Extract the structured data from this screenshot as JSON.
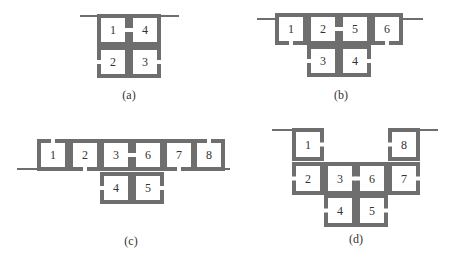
{
  "colors": {
    "wall": "#6e6e6e",
    "text": "#333333",
    "background": "#ffffff"
  },
  "panels": [
    {
      "id": "a",
      "caption": "(a)",
      "caption_pos": [
        129,
        99
      ],
      "lines": [
        [
          [
            80,
            16
          ],
          [
            99,
            16
          ]
        ],
        [
          [
            159,
            16
          ],
          [
            179,
            16
          ]
        ]
      ],
      "boxes": [
        {
          "label": "1",
          "x": 99,
          "y": 16,
          "w": 28,
          "h": 28,
          "gap": "right"
        },
        {
          "label": "4",
          "x": 131,
          "y": 16,
          "w": 28,
          "h": 28,
          "gap": "left"
        },
        {
          "label": "2",
          "x": 99,
          "y": 48,
          "w": 28,
          "h": 28,
          "gap": "left"
        },
        {
          "label": "3",
          "x": 131,
          "y": 48,
          "w": 28,
          "h": 28,
          "gap": "right"
        }
      ]
    },
    {
      "id": "b",
      "caption": "(b)",
      "caption_pos": [
        341,
        99
      ],
      "lines": [
        [
          [
            257,
            19
          ],
          [
            277,
            19
          ]
        ],
        [
          [
            401,
            19
          ],
          [
            423,
            19
          ]
        ]
      ],
      "boxes": [
        {
          "label": "1",
          "x": 277,
          "y": 15,
          "w": 28,
          "h": 28,
          "gap": "bottom"
        },
        {
          "label": "2",
          "x": 309,
          "y": 15,
          "w": 28,
          "h": 28,
          "gap": "right"
        },
        {
          "label": "5",
          "x": 341,
          "y": 15,
          "w": 28,
          "h": 28,
          "gap": "left"
        },
        {
          "label": "6",
          "x": 373,
          "y": 15,
          "w": 28,
          "h": 28,
          "gap": "bottom"
        },
        {
          "label": "3",
          "x": 309,
          "y": 47,
          "w": 28,
          "h": 28,
          "gap": "left"
        },
        {
          "label": "4",
          "x": 341,
          "y": 47,
          "w": 28,
          "h": 28,
          "gap": "right"
        }
      ]
    },
    {
      "id": "c",
      "caption": "(c)",
      "caption_pos": [
        131,
        245
      ],
      "lines": [
        [
          [
            17,
            169
          ],
          [
            39,
            169
          ]
        ],
        [
          [
            223,
            169
          ],
          [
            230,
            169
          ]
        ]
      ],
      "boxes": [
        {
          "label": "1",
          "x": 39,
          "y": 141,
          "w": 28,
          "h": 28,
          "gap": "top"
        },
        {
          "label": "2",
          "x": 71,
          "y": 141,
          "w": 28,
          "h": 28,
          "gap": "bottom"
        },
        {
          "label": "3",
          "x": 102,
          "y": 141,
          "w": 28,
          "h": 28,
          "gap": "right"
        },
        {
          "label": "6",
          "x": 134,
          "y": 141,
          "w": 28,
          "h": 28,
          "gap": "left"
        },
        {
          "label": "7",
          "x": 165,
          "y": 141,
          "w": 28,
          "h": 28,
          "gap": "bottom"
        },
        {
          "label": "8",
          "x": 195,
          "y": 141,
          "w": 28,
          "h": 28,
          "gap": "top"
        },
        {
          "label": "4",
          "x": 102,
          "y": 174,
          "w": 28,
          "h": 28,
          "gap": "left"
        },
        {
          "label": "5",
          "x": 134,
          "y": 174,
          "w": 28,
          "h": 28,
          "gap": "right"
        }
      ]
    },
    {
      "id": "d",
      "caption": "(d)",
      "caption_pos": [
        356,
        243
      ],
      "lines": [
        [
          [
            272,
            130
          ],
          [
            294,
            130
          ]
        ],
        [
          [
            418,
            130
          ],
          [
            438,
            130
          ]
        ]
      ],
      "boxes": [
        {
          "label": "1",
          "x": 294,
          "y": 130,
          "w": 28,
          "h": 29,
          "gap": "right"
        },
        {
          "label": "8",
          "x": 390,
          "y": 130,
          "w": 28,
          "h": 29,
          "gap": "left"
        },
        {
          "label": "2",
          "x": 294,
          "y": 164,
          "w": 28,
          "h": 29,
          "gap": "left"
        },
        {
          "label": "3",
          "x": 326,
          "y": 164,
          "w": 28,
          "h": 29,
          "gap": "right"
        },
        {
          "label": "6",
          "x": 358,
          "y": 164,
          "w": 28,
          "h": 29,
          "gap": "left"
        },
        {
          "label": "7",
          "x": 390,
          "y": 164,
          "w": 28,
          "h": 29,
          "gap": "right"
        },
        {
          "label": "4",
          "x": 326,
          "y": 196,
          "w": 28,
          "h": 29,
          "gap": "left"
        },
        {
          "label": "5",
          "x": 358,
          "y": 196,
          "w": 28,
          "h": 29,
          "gap": "right"
        }
      ]
    }
  ]
}
